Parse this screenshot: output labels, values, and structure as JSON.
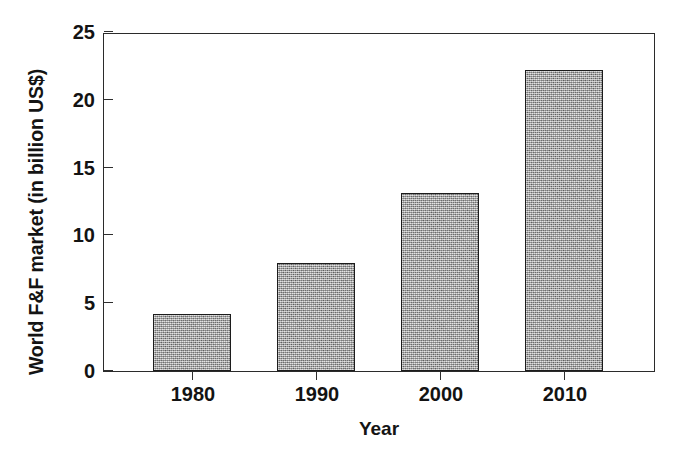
{
  "chart_data": {
    "type": "bar",
    "title": "",
    "subtitle": "",
    "xlabel": "Year",
    "ylabel": "World F&F market (in billion US$)",
    "categories": [
      "1980",
      "1990",
      "2000",
      "2010"
    ],
    "values": [
      4.2,
      8.0,
      13.1,
      22.2
    ],
    "series": [
      {
        "name": "World F&F market",
        "values": [
          4.2,
          8.0,
          13.1,
          22.2
        ]
      }
    ],
    "ylim": [
      0,
      25
    ],
    "ytick_labels": [
      "0",
      "5",
      "10",
      "15",
      "20",
      "25"
    ],
    "ytick_values": [
      0,
      5,
      10,
      15,
      20,
      25
    ],
    "xtick_labels": [
      "1980",
      "1990",
      "2000",
      "2010"
    ],
    "grid": false,
    "legend": null,
    "legend_position": "none",
    "annotations": [],
    "bar_fill_color": "#a9a9a9",
    "bar_edge_color": "#1c1c1c",
    "axis_color": "#2b2b2b",
    "background_color": "#ffffff",
    "text_color": "#131313"
  },
  "figure": {
    "name": "world-ff-market-bar-chart"
  }
}
